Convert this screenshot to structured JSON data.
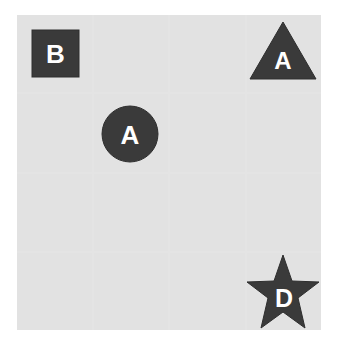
{
  "board": {
    "rows": 4,
    "cols": 4,
    "cell_color": "#e2e2e2",
    "line_color": "#f4f4f4"
  },
  "pieces": [
    {
      "shape": "square",
      "label": "B",
      "row": 0,
      "col": 0,
      "color": "#3a3a3a"
    },
    {
      "shape": "triangle",
      "label": "A",
      "row": 0,
      "col": 3,
      "color": "#3a3a3a"
    },
    {
      "shape": "circle",
      "label": "A",
      "row": 1,
      "col": 1,
      "color": "#3a3a3a"
    },
    {
      "shape": "star",
      "label": "D",
      "row": 3,
      "col": 3,
      "color": "#3a3a3a"
    }
  ]
}
